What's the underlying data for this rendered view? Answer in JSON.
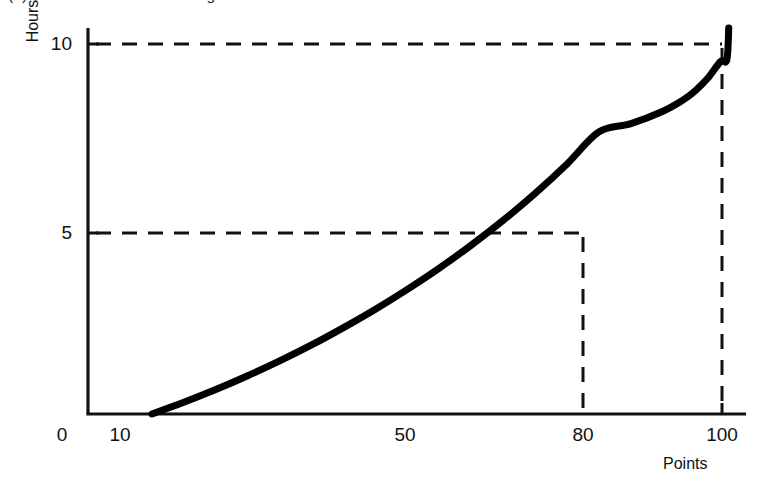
{
  "figure": {
    "caption": "(b) Increases at an increasing rate"
  },
  "axes": {
    "y_title": "Hours",
    "x_title": "Points",
    "origin_label": "0"
  },
  "ticks": {
    "y": [
      {
        "label": "10",
        "value": 10,
        "px_y": 44
      },
      {
        "label": "5",
        "value": 5,
        "px_y": 233
      }
    ],
    "x": [
      {
        "label": "0",
        "value": 0,
        "px_x": 62
      },
      {
        "label": "10",
        "value": 10,
        "px_x": 120
      },
      {
        "label": "50",
        "value": 50,
        "px_x": 405
      },
      {
        "label": "80",
        "value": 80,
        "px_x": 583
      },
      {
        "label": "100",
        "value": 100,
        "px_x": 722
      }
    ]
  },
  "chart_data": {
    "type": "line",
    "title": "(b) Increases at an increasing rate",
    "xlabel": "Points",
    "ylabel": "Hours",
    "xlim": [
      0,
      103
    ],
    "ylim": [
      0,
      10.9
    ],
    "grid": false,
    "legend": null,
    "xticks": [
      0,
      10,
      50,
      80,
      100
    ],
    "xticklabels": [
      "0",
      "10",
      "50",
      "80",
      "100"
    ],
    "yticks": [
      5,
      10
    ],
    "yticklabels": [
      "5",
      "10"
    ],
    "series": [
      {
        "name": "Study time curve",
        "style": "solid",
        "color": "#000000",
        "linewidth": 7,
        "x": [
          10,
          15,
          20,
          25,
          30,
          35,
          40,
          45,
          50,
          55,
          60,
          65,
          70,
          75,
          80,
          85,
          90,
          93,
          95,
          97,
          99,
          100,
          100.3
        ],
        "y": [
          0,
          0.33,
          0.69,
          1.08,
          1.5,
          1.95,
          2.44,
          2.96,
          3.52,
          4.12,
          4.77,
          5.47,
          6.23,
          7.06,
          7.97,
          8.2,
          8.55,
          8.85,
          9.12,
          9.48,
          9.95,
          10.0,
          10.9
        ]
      }
    ],
    "annotations": [
      {
        "type": "guide-lines",
        "label": "5 hours at 80 points",
        "x": 80,
        "y": 5,
        "style": "dashed"
      },
      {
        "type": "guide-lines",
        "label": "10 hours at 100 points",
        "x": 100,
        "y": 10,
        "style": "dashed"
      }
    ]
  },
  "colors": {
    "curve": "#000000",
    "axis": "#111111",
    "dash": "#111111",
    "background": "#ffffff"
  }
}
